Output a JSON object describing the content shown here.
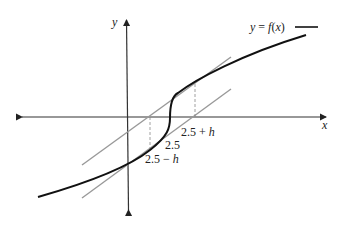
{
  "diagram": {
    "type": "function-graph-with-secant-bounds",
    "axes": {
      "x_label": "x",
      "y_label": "y"
    },
    "legend": {
      "label": "y = f(x)"
    },
    "tick_labels": {
      "center": "2.5",
      "plus": "2.5 + h",
      "minus": "2.5 − h"
    },
    "colors": {
      "curve": "#111111",
      "axes": "#333333",
      "bound_lines": "#999999",
      "dashed": "#888888"
    }
  }
}
